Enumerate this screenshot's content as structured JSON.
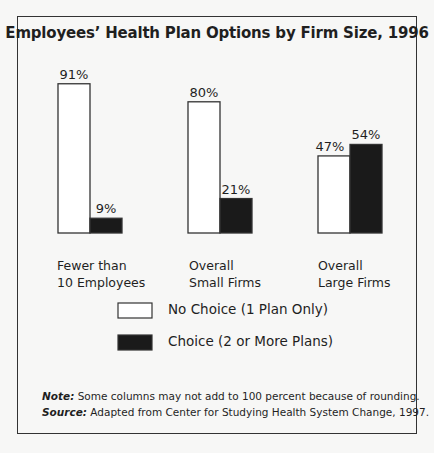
{
  "chart_data": {
    "type": "bar",
    "title": "Employees’ Health Plan Options by Firm Size, 1996",
    "categories": [
      [
        "Fewer than",
        "10 Employees"
      ],
      [
        "Overall",
        "Small Firms"
      ],
      [
        "Overall",
        "Large Firms"
      ]
    ],
    "series": [
      {
        "name": "No Choice (1 Plan Only)",
        "color": "#ffffff",
        "values": [
          91,
          80,
          47
        ]
      },
      {
        "name": "Choice (2 or More Plans)",
        "color": "#1a1a1a",
        "values": [
          9,
          21,
          54
        ]
      }
    ],
    "value_suffix": "%",
    "xlabel": "",
    "ylabel": "",
    "ylim": [
      0,
      100
    ],
    "grid": false,
    "legend": "bottom-center"
  },
  "notes": {
    "note_label": "Note:",
    "note_text": "Some columns may not add to 100 percent because of rounding.",
    "source_label": "Source:",
    "source_text": "Adapted from Center for Studying Health System Change, 1997."
  }
}
